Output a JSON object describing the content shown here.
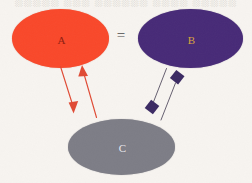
{
  "figure": {
    "background_color": "#f7f4f0",
    "width": 252,
    "height": 183,
    "top_clipped_text": "░░░░░ ░░░ ░░░░░░ ░░░░ ░░░░░"
  },
  "nodes": [
    {
      "id": "a",
      "label": "A",
      "shape": "ellipse",
      "fill_color": "#f9482a",
      "label_color": "#8e1d10"
    },
    {
      "id": "b",
      "label": "B",
      "shape": "ellipse",
      "fill_color": "#472a77",
      "label_color": "#d8a43c"
    },
    {
      "id": "c",
      "label": "C",
      "shape": "ellipse",
      "fill_color": "#7d7d86",
      "label_color": "#e9e9ef"
    }
  ],
  "relation": {
    "label": "=",
    "from": "a",
    "to": "b",
    "color": "#4a4a4a"
  },
  "connectors": [
    {
      "id": "a-to-c",
      "from": "a",
      "to": "c",
      "color": "#e04a34",
      "endpoint": "arrow",
      "direction": "down"
    },
    {
      "id": "c-to-a",
      "from": "c",
      "to": "a",
      "color": "#e04a34",
      "endpoint": "arrow",
      "direction": "up"
    },
    {
      "id": "b-to-c",
      "from": "b",
      "to": "c",
      "color": "#3b3248",
      "endpoint": "diamond",
      "endpoint_color": "#3b2a63",
      "direction": "down"
    },
    {
      "id": "c-to-b",
      "from": "c",
      "to": "b",
      "color": "#3b3248",
      "endpoint": "diamond",
      "endpoint_color": "#3b2a63",
      "direction": "up"
    }
  ]
}
